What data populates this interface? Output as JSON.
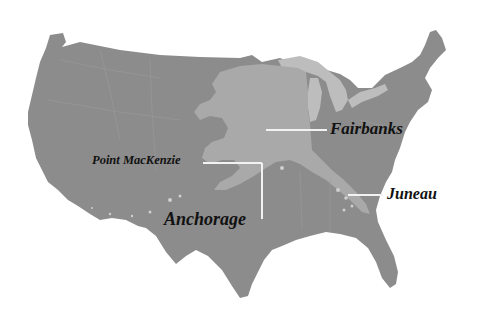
{
  "map": {
    "title": "",
    "description": "Outline of Alaska overlaid on the contiguous United States for size comparison",
    "colors": {
      "background": "#ffffff",
      "contiguous_us": "#8c8c8c",
      "alaska_overlay": "#a9a9a9",
      "great_lakes": "#bdbdbd",
      "leader_lines": "#f2f2f2",
      "label_text": "#111111"
    },
    "labels": [
      {
        "id": "fairbanks",
        "text": "Fairbanks"
      },
      {
        "id": "point-mackenzie",
        "text": "Point MacKenzie"
      },
      {
        "id": "anchorage",
        "text": "Anchorage"
      },
      {
        "id": "juneau",
        "text": "Juneau"
      }
    ]
  }
}
